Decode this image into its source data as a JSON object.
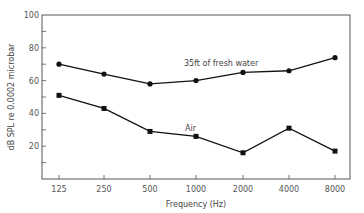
{
  "chart_data": {
    "type": "line",
    "title": "",
    "xlabel": "Frequency (Hz)",
    "ylabel": "dB SPL re 0.0002 microbar",
    "categories": [
      "125",
      "250",
      "500",
      "1000",
      "2000",
      "4000",
      "8000"
    ],
    "yticks": [
      "20",
      "40",
      "60",
      "80",
      "100"
    ],
    "ylim": [
      0,
      100
    ],
    "grid": false,
    "series": [
      {
        "name": "35ft of fresh water",
        "marker": "circle",
        "values": [
          70,
          64,
          58,
          60,
          65,
          66,
          74
        ]
      },
      {
        "name": "Air",
        "marker": "square",
        "values": [
          51,
          43,
          29,
          26,
          16,
          31,
          17
        ]
      }
    ],
    "annotations": [
      "35ft of fresh water",
      "Air"
    ]
  }
}
